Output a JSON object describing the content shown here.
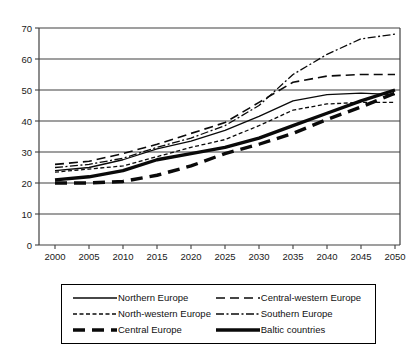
{
  "figure": {
    "background": "#ffffff",
    "line_color": "#0a0a0a",
    "grid_color": "#404040"
  },
  "chart_data": {
    "type": "line",
    "title": "",
    "xlabel": "",
    "ylabel": "",
    "x": [
      2000,
      2005,
      2010,
      2015,
      2020,
      2025,
      2030,
      2035,
      2040,
      2045,
      2050
    ],
    "ylim": [
      0,
      70
    ],
    "ytick_step": 10,
    "yticks": [
      0,
      10,
      20,
      30,
      40,
      50,
      60,
      70
    ],
    "grid": "horizontal",
    "legend_position": "bottom-boxed-two-columns",
    "series": [
      {
        "name": "Northern Europe",
        "style": "solid-thin",
        "values": [
          24,
          25,
          27.5,
          31,
          33.5,
          37,
          41.5,
          46.5,
          48.5,
          49,
          48.5
        ]
      },
      {
        "name": "Central-western Europe",
        "style": "longdash-thin",
        "values": [
          26,
          27,
          29.5,
          32.5,
          36,
          39.5,
          46,
          52.5,
          54.5,
          55,
          55
        ]
      },
      {
        "name": "North-western Europe",
        "style": "shortdash-thin",
        "values": [
          23.5,
          24.5,
          25.5,
          28.5,
          31.5,
          34,
          38.5,
          43.5,
          45.5,
          46,
          46
        ]
      },
      {
        "name": "Southern Europe",
        "style": "dashdot-thin",
        "values": [
          25,
          26,
          28,
          31.5,
          34.5,
          38.5,
          45,
          55,
          61.5,
          66.5,
          68
        ]
      },
      {
        "name": "Central Europe",
        "style": "longdash-thick",
        "values": [
          20,
          20,
          20.5,
          22.5,
          25.5,
          29.5,
          32.5,
          36,
          40.5,
          44.5,
          49
        ]
      },
      {
        "name": "Baltic countries",
        "style": "solid-thick",
        "values": [
          21,
          22,
          24,
          27.5,
          29.5,
          31.5,
          34.5,
          38.5,
          42.5,
          46.5,
          50
        ]
      }
    ]
  }
}
